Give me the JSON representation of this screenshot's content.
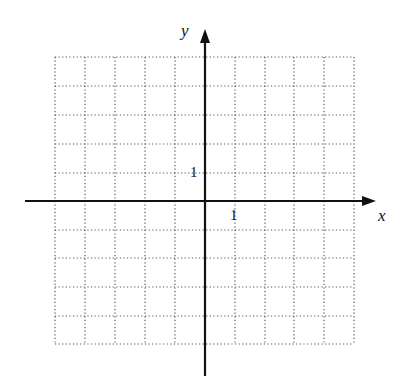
{
  "diagram": {
    "type": "coordinate-grid",
    "axes": {
      "x_label": "x",
      "y_label": "y"
    },
    "tick_labels": {
      "x_unit": "1",
      "y_unit": "1"
    },
    "grid": {
      "columns": 10,
      "rows": 10,
      "x_range": [
        -5,
        5
      ],
      "y_range": [
        -5,
        5
      ],
      "line_style": "dotted"
    },
    "colors": {
      "axis": "#111111",
      "grid": "#555555",
      "background": "#ffffff"
    }
  }
}
